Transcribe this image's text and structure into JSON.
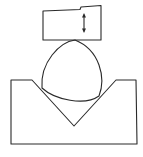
{
  "diagram": {
    "colors": {
      "line": "#2a2a2a",
      "background": "#ffffff"
    },
    "parts": [
      {
        "id": "anvil",
        "label": ""
      },
      {
        "id": "motion-arrow",
        "label": ""
      },
      {
        "id": "lobed-workpiece",
        "label": ""
      },
      {
        "id": "v-block",
        "label": ""
      }
    ]
  }
}
